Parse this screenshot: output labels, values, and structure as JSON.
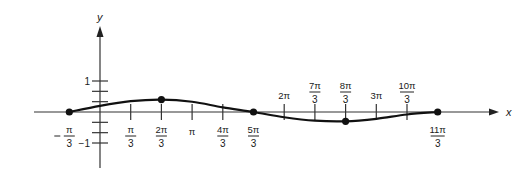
{
  "chart_data": {
    "type": "line",
    "title": "",
    "xlabel": "x",
    "ylabel": "y",
    "x_ticks": [
      {
        "value": -1,
        "num": "π",
        "den": "3",
        "neg": true,
        "label_side": "below"
      },
      {
        "value": 1,
        "num": "π",
        "den": "3",
        "neg": false,
        "label_side": "below"
      },
      {
        "value": 2,
        "num": "2π",
        "den": "3",
        "neg": false,
        "label_side": "below"
      },
      {
        "value": 3,
        "num": "π",
        "den": "",
        "neg": false,
        "label_side": "below"
      },
      {
        "value": 4,
        "num": "4π",
        "den": "3",
        "neg": false,
        "label_side": "below"
      },
      {
        "value": 5,
        "num": "5π",
        "den": "3",
        "neg": false,
        "label_side": "below"
      },
      {
        "value": 6,
        "num": "2π",
        "den": "",
        "neg": false,
        "label_side": "above"
      },
      {
        "value": 7,
        "num": "7π",
        "den": "3",
        "neg": false,
        "label_side": "above"
      },
      {
        "value": 8,
        "num": "8π",
        "den": "3",
        "neg": false,
        "label_side": "above"
      },
      {
        "value": 9,
        "num": "3π",
        "den": "",
        "neg": false,
        "label_side": "above"
      },
      {
        "value": 10,
        "num": "10π",
        "den": "3",
        "neg": false,
        "label_side": "above"
      },
      {
        "value": 11,
        "num": "11π",
        "den": "3",
        "neg": false,
        "label_side": "below"
      }
    ],
    "x_unit": "π/3",
    "y_ticks": [
      {
        "value": 1,
        "label": "1"
      },
      {
        "value": 0.667,
        "label": ""
      },
      {
        "value": 0.333,
        "label": ""
      },
      {
        "value": -0.333,
        "label": ""
      },
      {
        "value": -0.667,
        "label": ""
      },
      {
        "value": -1,
        "label": "−1"
      }
    ],
    "series": [
      {
        "name": "curve",
        "x_in_pi_over_3": [
          -1,
          0,
          1,
          2,
          3,
          4,
          5,
          6,
          7,
          8,
          9,
          10,
          11
        ],
        "y": [
          0,
          0.2,
          0.35,
          0.4,
          0.33,
          0.15,
          0,
          -0.17,
          -0.28,
          -0.3,
          -0.22,
          -0.08,
          0
        ]
      }
    ],
    "marked_points": [
      {
        "x_in_pi_over_3": -1,
        "y": 0
      },
      {
        "x_in_pi_over_3": 2,
        "y": 0.4
      },
      {
        "x_in_pi_over_3": 5,
        "y": 0
      },
      {
        "x_in_pi_over_3": 8,
        "y": -0.3
      },
      {
        "x_in_pi_over_3": 11,
        "y": 0
      }
    ],
    "xlim_in_pi_over_3": [
      -2.2,
      13.2
    ],
    "ylim": [
      -1.8,
      2.7
    ],
    "grid": false,
    "legend": "none"
  }
}
